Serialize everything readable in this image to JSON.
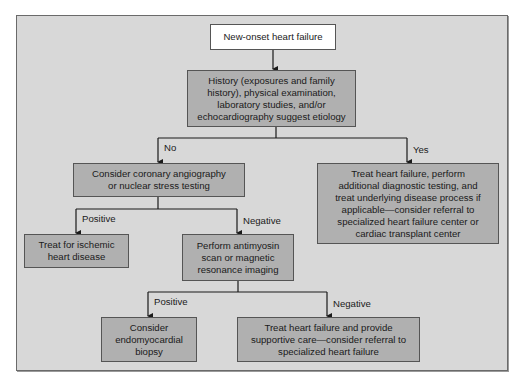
{
  "diagram": {
    "colors": {
      "background": "#d8d8d8",
      "box_fill": "#b0b0b0",
      "start_fill": "#ffffff",
      "border": "#555555",
      "line": "#1a1a1a"
    },
    "nodes": {
      "start": "New-onset heart failure",
      "history": "History (exposures and family\nhistory), physical examination,\nlaboratory studies, and/or\nechocardiography suggest etiology",
      "angiography": "Consider coronary angiography\nor nuclear stress testing",
      "treat_yes": "Treat heart failure, perform\nadditional diagnostic testing, and\ntreat underlying disease process if\napplicable—consider referral to\nspecialized heart failure center or\ncardiac transplant center",
      "ischemic": "Treat for ischemic\nheart disease",
      "antimyosin": "Perform antimyosin\nscan or magnetic\nresonance imaging",
      "biopsy": "Consider\nendomyocardial\nbiopsy",
      "supportive": "Treat heart failure and provide\nsupportive care—consider referral to\nspecialized heart failure"
    },
    "edge_labels": {
      "no": "No",
      "yes": "Yes",
      "positive_1": "Positive",
      "negative_1": "Negative",
      "positive_2": "Positive",
      "negative_2": "Negative"
    }
  }
}
